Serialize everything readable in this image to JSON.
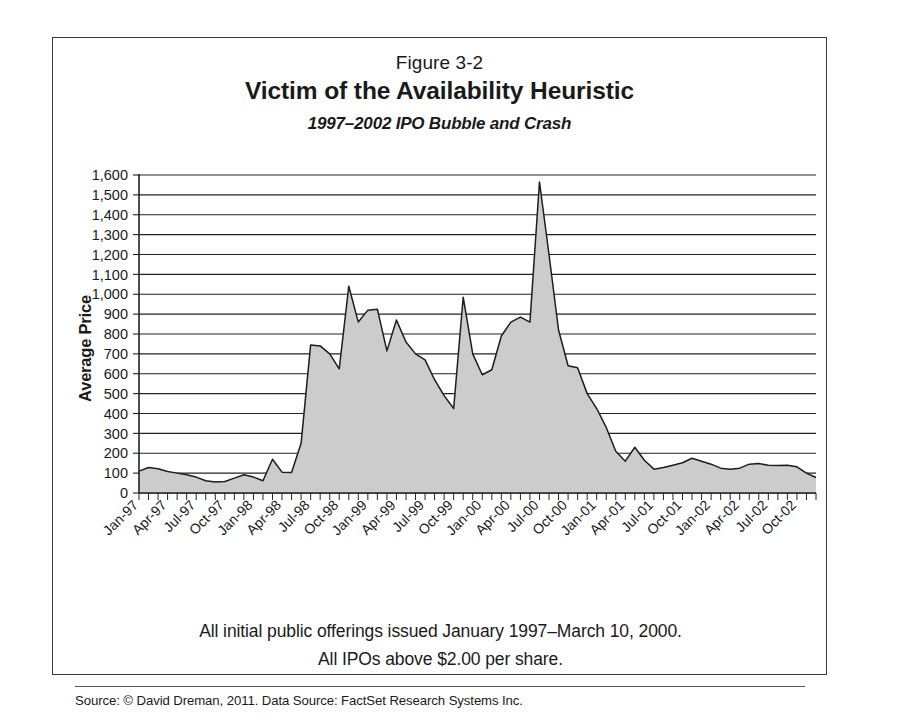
{
  "figure": {
    "label": "Figure 3-2",
    "title": "Victim of the Availability Heuristic",
    "subtitle": "1997–2002 IPO Bubble and Crash",
    "note_line_1": "All initial public offerings issued January 1997–March 10, 2000.",
    "note_line_2": "All IPOs above $2.00 per share.",
    "source": "Source: © David Dreman, 2011. Data Source: FactSet Research Systems Inc.",
    "frame_color": "#3a3a3a"
  },
  "chart_data": {
    "type": "area",
    "title": "Victim of the Availability Heuristic",
    "subtitle": "1997–2002 IPO Bubble and Crash",
    "xlabel": "",
    "ylabel": "Average Price",
    "ylim": [
      0,
      1600
    ],
    "ytick_step": 100,
    "ytick_labels": [
      "0",
      "100",
      "200",
      "300",
      "400",
      "500",
      "600",
      "700",
      "800",
      "900",
      "1,000",
      "1,100",
      "1,200",
      "1,300",
      "1,400",
      "1,500",
      "1,600"
    ],
    "grid": true,
    "legend": null,
    "series_color": "#cccccc",
    "line_color": "#1d1d1d",
    "minor_tick_interval_months": 1,
    "major_tick_interval_months": 3,
    "x_tick_labels": [
      "Jan-97",
      "Apr-97",
      "Jul-97",
      "Oct-97",
      "Jan-98",
      "Apr-98",
      "Jul-98",
      "Oct-98",
      "Jan-99",
      "Apr-99",
      "Jul-99",
      "Oct-99",
      "Jan-00",
      "Apr-00",
      "Jul-00",
      "Oct-00",
      "Jan-01",
      "Apr-01",
      "Jul-01",
      "Oct-01",
      "Jan-02",
      "Apr-02",
      "Jul-02",
      "Oct-02"
    ],
    "x": [
      "Jan-97",
      "Feb-97",
      "Mar-97",
      "Apr-97",
      "May-97",
      "Jun-97",
      "Jul-97",
      "Aug-97",
      "Sep-97",
      "Oct-97",
      "Nov-97",
      "Dec-97",
      "Jan-98",
      "Feb-98",
      "Mar-98",
      "Apr-98",
      "May-98",
      "Jun-98",
      "Jul-98",
      "Aug-98",
      "Sep-98",
      "Oct-98",
      "Nov-98",
      "Dec-98",
      "Jan-99",
      "Feb-99",
      "Mar-99",
      "Apr-99",
      "May-99",
      "Jun-99",
      "Jul-99",
      "Aug-99",
      "Sep-99",
      "Oct-99",
      "Nov-99",
      "Dec-99",
      "Jan-00",
      "Feb-00",
      "Mar-00",
      "Apr-00",
      "May-00",
      "Jun-00",
      "Jul-00",
      "Aug-00",
      "Sep-00",
      "Oct-00",
      "Nov-00",
      "Dec-00",
      "Jan-01",
      "Feb-01",
      "Mar-01",
      "Apr-01",
      "May-01",
      "Jun-01",
      "Jul-01",
      "Aug-01",
      "Sep-01",
      "Oct-01",
      "Nov-01",
      "Dec-01",
      "Jan-02",
      "Feb-02",
      "Mar-02",
      "Apr-02",
      "May-02",
      "Jun-02",
      "Jul-02",
      "Aug-02",
      "Sep-02",
      "Oct-02",
      "Nov-02",
      "Dec-02"
    ],
    "values": [
      110,
      128,
      122,
      108,
      100,
      92,
      80,
      62,
      55,
      58,
      75,
      92,
      80,
      62,
      170,
      105,
      103,
      250,
      745,
      740,
      700,
      625,
      1040,
      860,
      920,
      925,
      715,
      870,
      760,
      700,
      670,
      570,
      490,
      425,
      985,
      700,
      595,
      620,
      790,
      860,
      885,
      860,
      1565,
      1200,
      820,
      640,
      630,
      500,
      425,
      330,
      210,
      160,
      230,
      165,
      120,
      128,
      140,
      152,
      175,
      160,
      145,
      125,
      120,
      125,
      145,
      148,
      140,
      138,
      140,
      132,
      100,
      78
    ]
  }
}
